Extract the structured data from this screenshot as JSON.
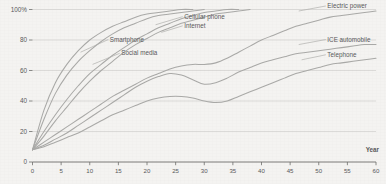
{
  "chart_data": {
    "type": "line",
    "title": "",
    "xlabel": "Year",
    "ylabel": "",
    "xlim": [
      0,
      60
    ],
    "ylim": [
      0,
      100
    ],
    "grid": true,
    "legend_position": "inline-labels",
    "x_ticks": [
      0,
      5,
      10,
      15,
      20,
      25,
      30,
      35,
      40,
      45,
      50,
      55,
      60
    ],
    "x_tick_labels": [
      "0",
      "5",
      "10",
      "15",
      "20",
      "25",
      "30",
      "35",
      "40",
      "45",
      "50",
      "55",
      "60"
    ],
    "y_ticks": [
      0,
      20,
      40,
      60,
      80,
      100
    ],
    "y_tick_labels": [
      "0",
      "20",
      "40",
      "60",
      "80",
      "100%"
    ],
    "x": [
      0,
      2,
      4,
      6,
      8,
      10,
      12,
      14,
      16,
      18,
      20,
      22,
      24,
      26,
      28,
      30,
      32,
      34,
      36,
      38,
      40,
      42,
      44,
      46,
      48,
      50,
      52,
      54,
      56,
      58,
      60
    ],
    "series": [
      {
        "name": "Smartphone",
        "label": "Smartphone",
        "label_x": 13.5,
        "label_y": 79,
        "leader_from_x": 8.4,
        "leader_from_y": 72,
        "values": [
          8,
          34,
          52,
          64,
          73,
          80,
          85,
          89,
          92,
          95,
          97,
          98,
          99,
          100,
          100,
          null,
          null,
          null,
          null,
          null,
          null,
          null,
          null,
          null,
          null,
          null,
          null,
          null,
          null,
          null,
          null
        ]
      },
      {
        "name": "Social media",
        "label": "Social media",
        "label_x": 15.5,
        "label_y": 70,
        "leader_from_x": 10.5,
        "leader_from_y": 64,
        "values": [
          8,
          28,
          45,
          57,
          66,
          73,
          79,
          84,
          88,
          91,
          94,
          96,
          97,
          98,
          99,
          100,
          null,
          null,
          null,
          null,
          null,
          null,
          null,
          null,
          null,
          null,
          null,
          null,
          null,
          null,
          null
        ]
      },
      {
        "name": "Cellular phone",
        "label": "Cellular phone",
        "label_x": 26.5,
        "label_y": 94,
        "leader_from_x": 21.5,
        "leader_from_y": 90,
        "values": [
          8,
          20,
          31,
          41,
          50,
          58,
          64,
          70,
          75,
          80,
          84,
          88,
          91,
          94,
          96,
          98,
          99,
          100,
          100,
          null,
          null,
          null,
          null,
          null,
          null,
          null,
          null,
          null,
          null,
          null,
          null
        ]
      },
      {
        "name": "Internet",
        "label": "Internet",
        "label_x": 26.5,
        "label_y": 88,
        "leader_from_x": 22.5,
        "leader_from_y": 85,
        "values": [
          8,
          17,
          27,
          36,
          45,
          53,
          60,
          66,
          72,
          77,
          81,
          85,
          88,
          91,
          93,
          95,
          97,
          98,
          99,
          100,
          null,
          null,
          null,
          null,
          null,
          null,
          null,
          null,
          null,
          null,
          null
        ]
      },
      {
        "name": "Electric power",
        "label": "Electric power",
        "label_x": 51.5,
        "label_y": 101,
        "leader_from_x": 46.5,
        "leader_from_y": 99,
        "values": [
          8,
          13,
          18,
          23,
          28,
          33,
          38,
          43,
          47,
          51,
          55,
          58,
          61,
          63,
          64,
          64,
          65,
          68,
          72,
          76,
          80,
          83,
          86,
          89,
          91,
          93,
          95,
          96,
          97,
          98,
          99
        ]
      },
      {
        "name": "ICE automobile",
        "label": "ICE automobile",
        "label_x": 51.5,
        "label_y": 79,
        "leader_from_x": 46.5,
        "leader_from_y": 77,
        "values": [
          8,
          11,
          15,
          19,
          24,
          29,
          34,
          39,
          44,
          49,
          53,
          56,
          58,
          57,
          54,
          51,
          52,
          55,
          59,
          62,
          65,
          67,
          69,
          71,
          72,
          73,
          74,
          75,
          76,
          77,
          77
        ]
      },
      {
        "name": "Telephone",
        "label": "Telephone",
        "label_x": 51.5,
        "label_y": 69,
        "leader_from_x": 47.0,
        "leader_from_y": 67,
        "values": [
          8,
          10,
          13,
          16,
          19,
          23,
          27,
          31,
          34,
          37,
          40,
          42,
          43,
          43,
          42,
          40,
          39,
          40,
          43,
          46,
          49,
          52,
          55,
          58,
          60,
          62,
          64,
          65,
          66,
          67,
          68
        ]
      }
    ]
  }
}
